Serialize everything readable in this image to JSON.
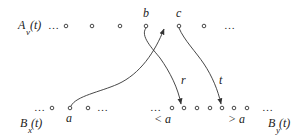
{
  "diagram": {
    "top_row": {
      "label": {
        "name": "A",
        "subscript": "v",
        "arg": "(t)"
      },
      "leading_ellipsis": "…",
      "nodes": [
        {
          "id": "n1",
          "label": ""
        },
        {
          "id": "n2",
          "label": ""
        },
        {
          "id": "n3",
          "label": ""
        },
        {
          "id": "b",
          "label": "b"
        },
        {
          "id": "c",
          "label": "c"
        },
        {
          "id": "n6",
          "label": ""
        }
      ],
      "trailing_ellipsis": "…"
    },
    "bottom_left_row": {
      "label": {
        "name": "B",
        "subscript": "x",
        "arg": "(t)"
      },
      "leading_ellipsis": "…",
      "nodes": [
        {
          "id": "bl1",
          "label": ""
        },
        {
          "id": "a",
          "label": "a"
        },
        {
          "id": "bl3",
          "label": ""
        }
      ],
      "trailing_ellipsis": "…"
    },
    "bottom_right_row": {
      "label": {
        "name": "B",
        "subscript": "y",
        "arg": "(t)"
      },
      "leading_ellipsis": "…",
      "nodes": [
        {
          "id": "br1",
          "label": ""
        },
        {
          "id": "r_target",
          "label": ""
        },
        {
          "id": "br3",
          "label": ""
        },
        {
          "id": "br4",
          "label": ""
        },
        {
          "id": "t_target",
          "label": ""
        },
        {
          "id": "br6",
          "label": ""
        },
        {
          "id": "br7",
          "label": ""
        }
      ],
      "trailing_ellipsis": "…",
      "region_labels": [
        "< a",
        "> a"
      ]
    },
    "edges": [
      {
        "from": "a",
        "to": "b",
        "label": ""
      },
      {
        "from": "b",
        "to": "r_target",
        "label": "r"
      },
      {
        "from": "c",
        "to": "t_target",
        "label": "t"
      }
    ]
  }
}
